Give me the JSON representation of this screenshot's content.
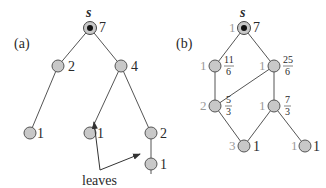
{
  "panel_a": {
    "label": "(a)",
    "source_label": "s",
    "nodes": [
      {
        "id": "s",
        "value": "7"
      },
      {
        "id": "a1",
        "value": "2"
      },
      {
        "id": "a2",
        "value": "4"
      },
      {
        "id": "a3",
        "value": "1"
      },
      {
        "id": "a4",
        "value": "1"
      },
      {
        "id": "a5",
        "value": "2"
      },
      {
        "id": "a6",
        "value": "1"
      }
    ],
    "annotation": "leaves"
  },
  "panel_b": {
    "label": "(b)",
    "source_label": "s",
    "nodes": [
      {
        "id": "s",
        "count": "1",
        "value": "7"
      },
      {
        "id": "b1",
        "count": "1",
        "num": "11",
        "den": "6"
      },
      {
        "id": "b2",
        "count": "1",
        "num": "25",
        "den": "6"
      },
      {
        "id": "b3",
        "count": "2",
        "num": "5",
        "den": "3"
      },
      {
        "id": "b4",
        "count": "1",
        "num": "7",
        "den": "3"
      },
      {
        "id": "b5",
        "count": "3",
        "value": "1"
      },
      {
        "id": "b6",
        "count": "1",
        "value": "1"
      }
    ]
  },
  "colors": {
    "node_fill": "#c8c8c8",
    "node_stroke": "#555555",
    "edge": "#555555",
    "count_text": "#9a9a9a"
  }
}
